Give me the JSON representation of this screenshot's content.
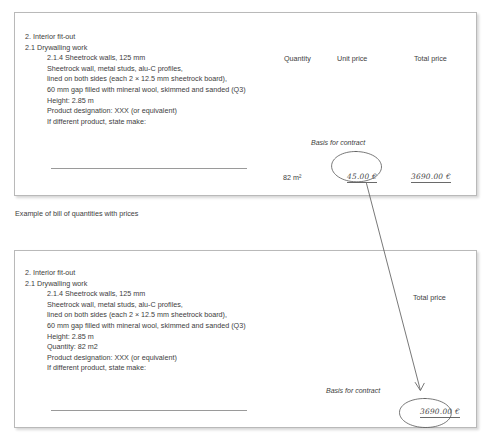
{
  "caption": "Example of bill of quantities with prices",
  "top_document": {
    "spec_lines": [
      {
        "text": "2. Interior fit-out",
        "indent": false
      },
      {
        "text": "2.1 Drywalling work",
        "indent": false
      },
      {
        "text": "2.1.4 Sheetrock walls, 125 mm",
        "indent": true
      },
      {
        "text": "Sheetrock wall, metal studs, alu-C profiles,",
        "indent": true
      },
      {
        "text": "lined on both sides (each 2 × 12.5 mm sheetrock board),",
        "indent": true
      },
      {
        "text": "60 mm gap filled with mineral wool, skimmed and sanded (Q3)",
        "indent": true
      },
      {
        "text": "Height: 2.85 m",
        "indent": true
      },
      {
        "text": "Product designation: XXX (or equivalent)",
        "indent": true
      },
      {
        "text": "If different product, state make:",
        "indent": true
      }
    ],
    "columns": {
      "quantity": "Quantity",
      "unit_price": "Unit price",
      "total_price": "Total price"
    },
    "values": {
      "quantity": "82 m²",
      "unit_price_handwritten": "45.00 €",
      "total_price_handwritten": "3690.00 €"
    },
    "annotation": "Basis for contract"
  },
  "bottom_document": {
    "spec_lines": [
      {
        "text": "2. Interior fit-out",
        "indent": false
      },
      {
        "text": "2.1 Drywalling work",
        "indent": false
      },
      {
        "text": "2.1.4 Sheetrock walls, 125 mm",
        "indent": true
      },
      {
        "text": "Sheetrock wall, metal studs, alu-C profiles,",
        "indent": true
      },
      {
        "text": "lined on both sides (each 2 × 12.5 mm sheetrock board),",
        "indent": true
      },
      {
        "text": "60 mm gap filled with mineral wool, skimmed and sanded (Q3)",
        "indent": true
      },
      {
        "text": "Height: 2.85 m",
        "indent": true
      },
      {
        "text": "Quantity: 82 m2",
        "indent": true
      },
      {
        "text": "Product designation: XXX (or equivalent)",
        "indent": true
      },
      {
        "text": "If different product, state make:",
        "indent": true
      }
    ],
    "columns": {
      "total_price": "Total price"
    },
    "values": {
      "total_price_handwritten": "3690.00 €"
    },
    "annotation": "Basis for contract"
  },
  "colors": {
    "page_background": "#ffffff",
    "text": "#3d3d3d",
    "box_border": "#b9b9b9",
    "ink": "#555555",
    "rule": "#9a9a9a"
  }
}
